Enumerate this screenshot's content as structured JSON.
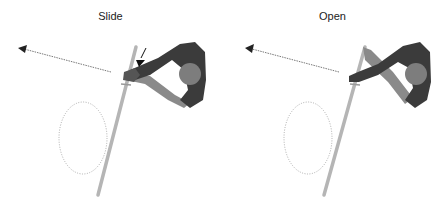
{
  "panels": [
    {
      "title": "Slide",
      "elements": [
        "direction-arrow",
        "pole",
        "person-top-view",
        "indicator-arrow",
        "rotation-ellipse"
      ]
    },
    {
      "title": "Open",
      "elements": [
        "direction-arrow",
        "pole",
        "person-top-view",
        "rotation-ellipse"
      ]
    }
  ],
  "colors": {
    "body": "#3b3b3b",
    "head": "#7d7d7d",
    "arm_light": "#8a8a8a",
    "pole": "#b5b5b5",
    "dotted_line": "#555555",
    "ellipse": "#999999"
  }
}
